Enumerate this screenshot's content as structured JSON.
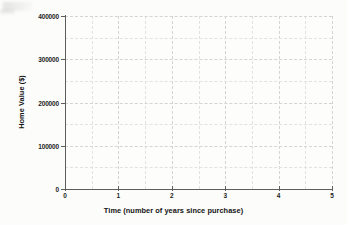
{
  "figure": {
    "background_color": "#fcfcfb",
    "plot_background_color": "#fdfdfc",
    "axis_color": "#5d5d5d",
    "gridline_color": "#e2e2e2",
    "gridline_major_color": "#d4d4d4",
    "text_color": "#1c1c1c"
  },
  "chart_data": {
    "type": "line",
    "title": "",
    "subtitle": "",
    "xlabel": "Time (number of years since purchase)",
    "ylabel": "Home Value ($)",
    "xlim": [
      0,
      5
    ],
    "ylim": [
      0,
      400000
    ],
    "x_ticks": [
      0,
      1,
      2,
      3,
      4,
      5
    ],
    "x_tick_labels": [
      "0",
      "1",
      "2",
      "3",
      "4",
      "5"
    ],
    "y_ticks": [
      0,
      100000,
      200000,
      300000,
      400000
    ],
    "y_tick_labels": [
      "0",
      "100000",
      "200000",
      "300000",
      "400000"
    ],
    "x_minor_step": 0.5,
    "y_minor_step": 50000,
    "grid": true,
    "grid_style": "dashed",
    "legend": null,
    "legend_position": "none",
    "annotations": [],
    "series": [],
    "x": [],
    "values": [],
    "note": "Empty plot grid: axes and gridlines drawn, no data series plotted."
  }
}
